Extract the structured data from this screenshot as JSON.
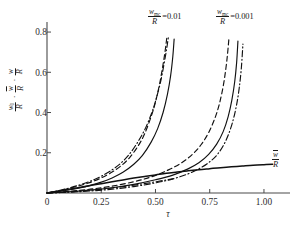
{
  "figure": {
    "background": "#ffffff",
    "ink_color": "#111111",
    "axis_color": "#4a4a4a"
  },
  "axes": {
    "x_label": "τ",
    "x_ticks": [
      "0",
      "0.25",
      "0.50",
      "0.75",
      "1.00"
    ],
    "x_tick_values": [
      0,
      0.25,
      0.5,
      0.75,
      1.0
    ],
    "x_range": [
      0,
      1.12
    ],
    "y_ticks": [
      "0.2",
      "0.4",
      "0.6",
      "0.8"
    ],
    "y_tick_values": [
      0.2,
      0.4,
      0.6,
      0.8
    ],
    "y_range": [
      0,
      0.85
    ],
    "y_caption": {
      "term1_num": "w",
      "term1_sub": "0",
      "term1_den": "R",
      "term2_num": "w",
      "term2_overline": true,
      "term2_den": "R",
      "term3_num": "w",
      "term3_den": "R",
      "separator": "·"
    }
  },
  "annotations": {
    "family1": {
      "num": "w",
      "sub": "mc",
      "den": "R",
      "equals": "=0.01",
      "x_px": 148,
      "y_px": 8
    },
    "family2": {
      "num": "w",
      "sub": "mc",
      "den": "R",
      "equals": "=0.001",
      "x_px": 216,
      "y_px": 8
    },
    "wbar_curve_label": {
      "num": "w",
      "overline": true,
      "den": "R",
      "x_px": 272,
      "y_px": 150
    }
  },
  "chart_data": {
    "type": "line",
    "title": "",
    "xlabel": "τ",
    "ylabel": "w_0/R , w̄/R , w/R",
    "xlim": [
      0,
      1.12
    ],
    "ylim": [
      0,
      0.85
    ],
    "grid": false,
    "legend": "none",
    "annotations": [
      "w_mc/R =0.01",
      "w_mc/R =0.001",
      "w̄/R"
    ],
    "series": [
      {
        "name": "w_0/R, w_mc/R=0.01, dashed",
        "style": "dashed",
        "group": "0.01",
        "x": [
          0.0,
          0.05,
          0.1,
          0.15,
          0.2,
          0.25,
          0.3,
          0.34,
          0.38,
          0.42,
          0.45,
          0.48,
          0.5,
          0.52,
          0.535,
          0.545,
          0.552
        ],
        "y": [
          0.0,
          0.01,
          0.022,
          0.036,
          0.053,
          0.075,
          0.104,
          0.134,
          0.175,
          0.234,
          0.294,
          0.38,
          0.452,
          0.548,
          0.64,
          0.71,
          0.77
        ]
      },
      {
        "name": "w/R, w_mc/R=0.01, solid",
        "style": "solid",
        "group": "0.01",
        "x": [
          0.0,
          0.05,
          0.1,
          0.15,
          0.2,
          0.25,
          0.3,
          0.35,
          0.4,
          0.44,
          0.48,
          0.51,
          0.535,
          0.555,
          0.57,
          0.58,
          0.586
        ],
        "y": [
          0.0,
          0.007,
          0.015,
          0.025,
          0.038,
          0.054,
          0.075,
          0.103,
          0.143,
          0.187,
          0.253,
          0.32,
          0.4,
          0.49,
          0.585,
          0.68,
          0.765
        ]
      },
      {
        "name": "w̄/R, w_mc/R=0.01, dash-dot",
        "style": "dashdot",
        "group": "0.01",
        "x": [
          0.0,
          0.05,
          0.1,
          0.15,
          0.2,
          0.25,
          0.3,
          0.34,
          0.38,
          0.42,
          0.455,
          0.485,
          0.505,
          0.525,
          0.54,
          0.552,
          0.56
        ],
        "y": [
          0.0,
          0.011,
          0.024,
          0.04,
          0.059,
          0.083,
          0.115,
          0.148,
          0.193,
          0.256,
          0.325,
          0.405,
          0.475,
          0.56,
          0.645,
          0.72,
          0.78
        ]
      },
      {
        "name": "w_0/R, w_mc/R=0.001, dashed",
        "style": "dashed",
        "group": "0.001",
        "x": [
          0.0,
          0.1,
          0.2,
          0.3,
          0.4,
          0.48,
          0.56,
          0.62,
          0.67,
          0.71,
          0.745,
          0.775,
          0.795,
          0.812,
          0.824,
          0.832,
          0.838
        ],
        "y": [
          0.0,
          0.008,
          0.019,
          0.034,
          0.056,
          0.08,
          0.115,
          0.15,
          0.192,
          0.24,
          0.3,
          0.375,
          0.445,
          0.53,
          0.615,
          0.69,
          0.762
        ]
      },
      {
        "name": "w/R, w_mc/R=0.001, solid",
        "style": "solid",
        "group": "0.001",
        "x": [
          0.0,
          0.1,
          0.2,
          0.3,
          0.4,
          0.5,
          0.58,
          0.65,
          0.7,
          0.745,
          0.782,
          0.812,
          0.835,
          0.852,
          0.865,
          0.874,
          0.88
        ],
        "y": [
          0.0,
          0.006,
          0.014,
          0.026,
          0.043,
          0.066,
          0.089,
          0.12,
          0.15,
          0.192,
          0.243,
          0.305,
          0.38,
          0.462,
          0.552,
          0.648,
          0.755
        ]
      },
      {
        "name": "w̄/R, w_mc/R=0.001, dash-dot",
        "style": "dashdot",
        "group": "0.001",
        "x": [
          0.0,
          0.1,
          0.2,
          0.3,
          0.4,
          0.5,
          0.58,
          0.65,
          0.7,
          0.75,
          0.79,
          0.825,
          0.852,
          0.872,
          0.886,
          0.896,
          0.903
        ],
        "y": [
          0.0,
          0.004,
          0.01,
          0.019,
          0.032,
          0.05,
          0.07,
          0.095,
          0.12,
          0.155,
          0.198,
          0.262,
          0.34,
          0.428,
          0.522,
          0.625,
          0.74
        ]
      },
      {
        "name": "w̄/R saturating curve",
        "style": "solid",
        "group": "wbar",
        "x": [
          0.0,
          0.05,
          0.1,
          0.15,
          0.2,
          0.25,
          0.3,
          0.35,
          0.4,
          0.45,
          0.5,
          0.55,
          0.6,
          0.65,
          0.7,
          0.75,
          0.8,
          0.85,
          0.9,
          0.95,
          1.0,
          1.04
        ],
        "y": [
          0.0,
          0.009,
          0.018,
          0.027,
          0.037,
          0.046,
          0.056,
          0.065,
          0.074,
          0.082,
          0.09,
          0.098,
          0.104,
          0.11,
          0.116,
          0.121,
          0.126,
          0.13,
          0.134,
          0.138,
          0.141,
          0.143
        ]
      },
      {
        "name": "lower dash-dot branch",
        "style": "dashdot",
        "group": "lower",
        "x": [
          0.0,
          0.06,
          0.12,
          0.18,
          0.24,
          0.3,
          0.36,
          0.42,
          0.48,
          0.54,
          0.58
        ],
        "y": [
          0.0,
          0.003,
          0.007,
          0.012,
          0.018,
          0.025,
          0.033,
          0.042,
          0.052,
          0.063,
          0.07
        ]
      }
    ]
  }
}
